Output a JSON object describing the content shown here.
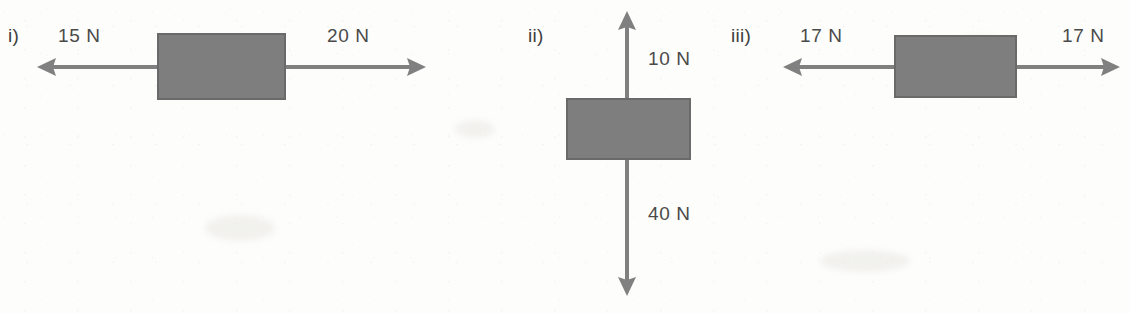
{
  "figure": {
    "background_color": "#fdfdfb",
    "block_color": "#7e7e7e",
    "arrow_color": "#808080",
    "text_color": "#4a4a4a"
  },
  "diagrams": [
    {
      "id": "i",
      "label": "i)",
      "orientation": "horizontal",
      "forces": [
        {
          "name": "left-force",
          "value": "15 N",
          "magnitude": 15,
          "unit": "N",
          "direction": "left"
        },
        {
          "name": "right-force",
          "value": "20 N",
          "magnitude": 20,
          "unit": "N",
          "direction": "right"
        }
      ]
    },
    {
      "id": "ii",
      "label": "ii)",
      "orientation": "vertical",
      "forces": [
        {
          "name": "up-force",
          "value": "10 N",
          "magnitude": 10,
          "unit": "N",
          "direction": "up"
        },
        {
          "name": "down-force",
          "value": "40 N",
          "magnitude": 40,
          "unit": "N",
          "direction": "down"
        }
      ]
    },
    {
      "id": "iii",
      "label": "iii)",
      "orientation": "horizontal",
      "forces": [
        {
          "name": "left-force",
          "value": "17 N",
          "magnitude": 17,
          "unit": "N",
          "direction": "left"
        },
        {
          "name": "right-force",
          "value": "17 N",
          "magnitude": 17,
          "unit": "N",
          "direction": "right"
        }
      ]
    }
  ]
}
